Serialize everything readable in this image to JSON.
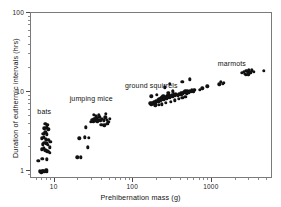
{
  "chart_data": {
    "type": "scatter",
    "title": "",
    "xlabel": "Prehibernation mass (g)",
    "ylabel": "Duration of euthermic intervals (hrs)",
    "xscale": "log",
    "yscale": "log",
    "xlim": [
      5,
      6000
    ],
    "ylim": [
      0.8,
      100
    ],
    "xticks": [
      10,
      100,
      1000
    ],
    "xticklabels": [
      "10",
      "100",
      "1000"
    ],
    "yticks": [
      1,
      10,
      100
    ],
    "yticklabels": [
      "1",
      "10",
      "100"
    ],
    "grid": false,
    "legend": "inline-group-labels",
    "marker": "filled-circle",
    "marker_color": "#111111",
    "annotations": [
      {
        "text": "bats",
        "x": 7.6,
        "y": 5.6
      },
      {
        "text": "jumping mice",
        "x": 30,
        "y": 8.2
      },
      {
        "text": "ground squirrels",
        "x": 175,
        "y": 12.0
      },
      {
        "text": "marmots",
        "x": 1850,
        "y": 23.0
      }
    ],
    "series": [
      {
        "name": "bats",
        "color": "#111111",
        "points": [
          [
            6.2,
            1.35
          ],
          [
            6.5,
            1.0
          ],
          [
            6.8,
            0.97
          ],
          [
            7.0,
            1.02
          ],
          [
            7.2,
            1.0
          ],
          [
            7.5,
            0.98
          ],
          [
            7.8,
            1.05
          ],
          [
            8.0,
            1.0
          ],
          [
            7.0,
            1.45
          ],
          [
            7.9,
            1.42
          ],
          [
            6.9,
            1.9
          ],
          [
            7.3,
            1.95
          ],
          [
            7.6,
            1.85
          ],
          [
            8.1,
            1.8
          ],
          [
            8.4,
            1.75
          ],
          [
            7.1,
            2.2
          ],
          [
            7.4,
            2.3
          ],
          [
            7.8,
            2.25
          ],
          [
            8.2,
            2.15
          ],
          [
            6.9,
            2.6
          ],
          [
            7.3,
            2.7
          ],
          [
            7.7,
            2.55
          ],
          [
            8.3,
            2.5
          ],
          [
            7.2,
            3.0
          ],
          [
            7.6,
            3.1
          ],
          [
            8.0,
            2.95
          ],
          [
            7.4,
            3.5
          ],
          [
            7.9,
            3.6
          ],
          [
            8.3,
            3.4
          ],
          [
            7.6,
            4.0
          ],
          [
            8.1,
            3.9
          ],
          [
            8.6,
            2.0
          ],
          [
            8.7,
            1.7
          ],
          [
            8.8,
            2.35
          ]
        ]
      },
      {
        "name": "jumping mice",
        "color": "#111111",
        "points": [
          [
            19.5,
            1.5
          ],
          [
            21.5,
            1.5
          ],
          [
            20.5,
            2.6
          ],
          [
            24.0,
            2.7
          ],
          [
            26.5,
            2.0
          ],
          [
            27.0,
            2.65
          ],
          [
            25.0,
            3.6
          ],
          [
            29.0,
            4.2
          ],
          [
            30.0,
            4.5
          ],
          [
            31.0,
            4.3
          ],
          [
            32.0,
            4.6
          ],
          [
            33.0,
            4.4
          ],
          [
            34.0,
            4.7
          ],
          [
            35.0,
            4.3
          ],
          [
            36.0,
            4.5
          ],
          [
            37.0,
            4.9
          ],
          [
            38.0,
            4.4
          ],
          [
            33.5,
            5.0
          ],
          [
            31.5,
            5.2
          ],
          [
            36.5,
            5.1
          ],
          [
            40.0,
            4.6
          ],
          [
            42.0,
            4.4
          ],
          [
            44.0,
            4.8
          ],
          [
            46.0,
            4.5
          ],
          [
            48.0,
            4.2
          ],
          [
            50.0,
            4.6
          ],
          [
            45.0,
            5.3
          ],
          [
            39.0,
            3.9
          ],
          [
            43.0,
            3.8
          ],
          [
            47.0,
            4.0
          ]
        ]
      },
      {
        "name": "ground squirrels",
        "color": "#111111",
        "points": [
          [
            165,
            7.2
          ],
          [
            170,
            7.0
          ],
          [
            175,
            7.4
          ],
          [
            180,
            7.1
          ],
          [
            185,
            7.6
          ],
          [
            190,
            7.3
          ],
          [
            195,
            7.8
          ],
          [
            200,
            7.5
          ],
          [
            205,
            8.0
          ],
          [
            210,
            7.7
          ],
          [
            215,
            8.2
          ],
          [
            220,
            7.9
          ],
          [
            225,
            8.4
          ],
          [
            230,
            8.1
          ],
          [
            235,
            8.6
          ],
          [
            240,
            8.3
          ],
          [
            245,
            8.0
          ],
          [
            250,
            8.5
          ],
          [
            255,
            8.2
          ],
          [
            260,
            8.7
          ],
          [
            265,
            8.4
          ],
          [
            270,
            8.9
          ],
          [
            275,
            8.6
          ],
          [
            280,
            9.1
          ],
          [
            285,
            8.8
          ],
          [
            290,
            8.5
          ],
          [
            295,
            9.0
          ],
          [
            300,
            8.7
          ],
          [
            310,
            9.2
          ],
          [
            320,
            8.9
          ],
          [
            330,
            9.4
          ],
          [
            340,
            9.1
          ],
          [
            350,
            9.6
          ],
          [
            360,
            9.3
          ],
          [
            370,
            9.0
          ],
          [
            380,
            9.5
          ],
          [
            390,
            9.2
          ],
          [
            400,
            9.7
          ],
          [
            410,
            9.4
          ],
          [
            420,
            9.9
          ],
          [
            430,
            9.6
          ],
          [
            440,
            10.1
          ],
          [
            450,
            9.8
          ],
          [
            460,
            10.3
          ],
          [
            470,
            10.0
          ],
          [
            480,
            9.7
          ],
          [
            490,
            10.2
          ],
          [
            500,
            9.9
          ],
          [
            520,
            10.4
          ],
          [
            540,
            10.1
          ],
          [
            560,
            10.6
          ],
          [
            580,
            10.3
          ],
          [
            600,
            10.8
          ],
          [
            190,
            6.8
          ],
          [
            210,
            6.9
          ],
          [
            230,
            7.0
          ],
          [
            260,
            7.3
          ],
          [
            300,
            7.6
          ],
          [
            340,
            7.9
          ],
          [
            380,
            8.2
          ],
          [
            420,
            8.5
          ],
          [
            460,
            8.8
          ],
          [
            170,
            8.9
          ],
          [
            200,
            9.3
          ],
          [
            240,
            9.0
          ],
          [
            280,
            9.8
          ],
          [
            320,
            10.2
          ],
          [
            250,
            11.5
          ],
          [
            290,
            12.8
          ],
          [
            420,
            13.5
          ],
          [
            520,
            14.5
          ],
          [
            700,
            10.8
          ],
          [
            760,
            11.2
          ],
          [
            880,
            11.8
          ]
        ]
      },
      {
        "name": "marmots",
        "color": "#111111",
        "points": [
          [
            1250,
            12.5
          ],
          [
            1300,
            13.5
          ],
          [
            1380,
            12.8
          ],
          [
            1420,
            13.2
          ],
          [
            2400,
            17.5
          ],
          [
            2550,
            18.0
          ],
          [
            2650,
            17.0
          ],
          [
            2750,
            18.5
          ],
          [
            2850,
            17.8
          ],
          [
            2950,
            19.0
          ],
          [
            3050,
            18.2
          ],
          [
            3150,
            17.5
          ],
          [
            3250,
            18.8
          ],
          [
            3400,
            18.0
          ],
          [
            2700,
            16.5
          ],
          [
            2900,
            16.8
          ],
          [
            4600,
            18.5
          ]
        ]
      }
    ]
  }
}
